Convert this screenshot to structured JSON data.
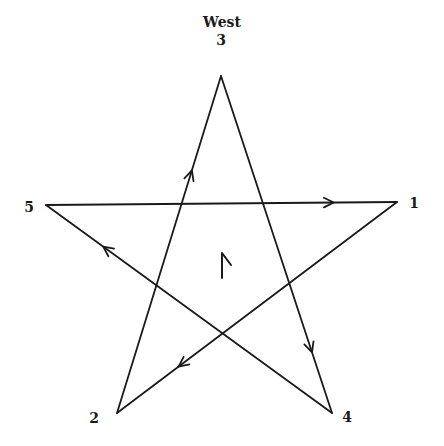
{
  "diagram": {
    "direction_label": "West",
    "center_glyph": "rune-icon",
    "line_color": "#1a1a1a",
    "vertices": [
      {
        "id": "1",
        "label": "1",
        "x": 397,
        "y": 202,
        "label_x": 414,
        "label_y": 208
      },
      {
        "id": "2",
        "label": "2",
        "x": 117,
        "y": 413,
        "label_x": 94,
        "label_y": 423
      },
      {
        "id": "3",
        "label": "3",
        "x": 221,
        "y": 76,
        "label_x": 221,
        "label_y": 45
      },
      {
        "id": "4",
        "label": "4",
        "x": 332,
        "y": 413,
        "label_x": 347,
        "label_y": 422
      },
      {
        "id": "5",
        "label": "5",
        "x": 46,
        "y": 205,
        "label_x": 29,
        "label_y": 212
      }
    ],
    "edges": [
      {
        "from": "2",
        "to": "3",
        "arrow_at": 0.72
      },
      {
        "from": "3",
        "to": "4",
        "arrow_at": 0.82
      },
      {
        "from": "4",
        "to": "5",
        "arrow_at": 0.8
      },
      {
        "from": "5",
        "to": "1",
        "arrow_at": 0.82
      },
      {
        "from": "1",
        "to": "2",
        "arrow_at": 0.78
      }
    ],
    "drawing_order": [
      "2",
      "3",
      "4",
      "5",
      "1",
      "2"
    ]
  }
}
